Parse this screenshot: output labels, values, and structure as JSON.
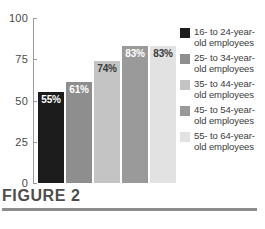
{
  "chart_data": {
    "type": "bar",
    "title": "FIGURE 2",
    "xlabel": "",
    "ylabel": "",
    "ylim": [
      0,
      100
    ],
    "ytick_labels": [
      "100",
      "75",
      "50",
      "25",
      "0"
    ],
    "ytick_values": [
      100,
      75,
      50,
      25,
      0
    ],
    "grid": false,
    "legend_position": "right",
    "categories": [
      "16- to 24-year-old employees",
      "25- to 34-year-old employees",
      "35- to 44-year-old employees",
      "45- to 54-year-old employees",
      "55- to 64-year-old employees"
    ],
    "values": [
      55,
      61,
      74,
      83,
      83
    ],
    "data_labels": [
      "55%",
      "61%",
      "74%",
      "83%",
      "83%"
    ],
    "bar_colors": [
      "#1c1c1c",
      "#8e8e8e",
      "#c4c4c4",
      "#9a9a9a",
      "#e2e2e2"
    ],
    "data_label_colors": [
      "#ffffff",
      "#ffffff",
      "#3a3a3a",
      "#ffffff",
      "#3a3a3a"
    ]
  },
  "legend": {
    "items": [
      {
        "label_line1": "16- to 24-year-",
        "label_line2": "old employees",
        "color": "#1c1c1c"
      },
      {
        "label_line1": "25- to 34-year-",
        "label_line2": "old employees",
        "color": "#8e8e8e"
      },
      {
        "label_line1": "35- to 44-year-",
        "label_line2": "old employees",
        "color": "#c4c4c4"
      },
      {
        "label_line1": "45- to 54-year-",
        "label_line2": "old employees",
        "color": "#9a9a9a"
      },
      {
        "label_line1": "55- to 64-year-",
        "label_line2": "old employees",
        "color": "#e2e2e2"
      }
    ]
  },
  "caption": {
    "title": "FIGURE 2"
  }
}
